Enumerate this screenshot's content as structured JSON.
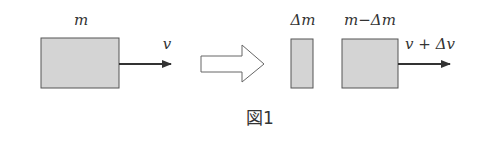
{
  "figure": {
    "caption": "図1",
    "before": {
      "mass_label": "m",
      "velocity_label": "v"
    },
    "transition_arrow": "hollow-right-arrow",
    "after": {
      "ejected_mass_label": "Δm",
      "remaining_mass_label": "m−Δm",
      "velocity_label": "v + Δv"
    }
  },
  "colors": {
    "block_fill": "#d4d4d4",
    "stroke": "#555555",
    "text": "#333333"
  }
}
